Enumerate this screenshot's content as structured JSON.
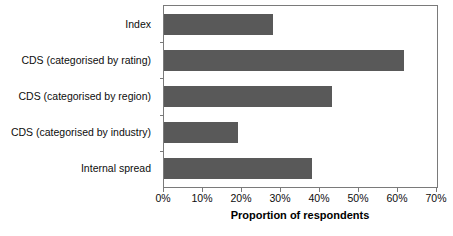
{
  "chart_data": {
    "type": "bar",
    "orientation": "horizontal",
    "title": "",
    "xlabel": "Proportion of respondents",
    "ylabel": "",
    "xlim": [
      0,
      70
    ],
    "xtick_labels": [
      "0%",
      "10%",
      "20%",
      "30%",
      "40%",
      "50%",
      "60%",
      "70%"
    ],
    "xtick_values": [
      0,
      10,
      20,
      30,
      40,
      50,
      60,
      70
    ],
    "grid": false,
    "legend": false,
    "bar_color": "#595959",
    "categories": [
      "Index",
      "CDS (categorised by rating)",
      "CDS (categorised by region)",
      "CDS (categorised by industry)",
      "Internal spread"
    ],
    "values": [
      28,
      61.5,
      43,
      19,
      38
    ]
  }
}
